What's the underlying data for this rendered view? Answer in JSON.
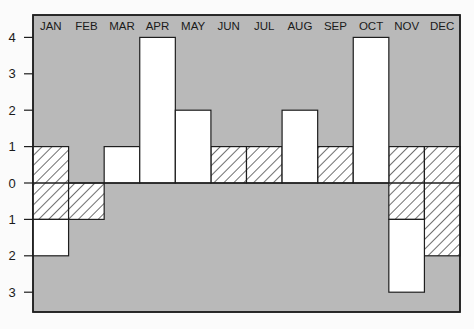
{
  "chart_data": {
    "type": "bar",
    "title": "",
    "xlabel": "",
    "ylabel": "",
    "categories": [
      "JAN",
      "FEB",
      "MAR",
      "APR",
      "MAY",
      "JUN",
      "JUL",
      "AUG",
      "SEP",
      "OCT",
      "NOV",
      "DEC"
    ],
    "series": [
      {
        "name": "Hatched band",
        "style": "hatched",
        "ranges": [
          [
            -1,
            1
          ],
          [
            -1,
            0
          ],
          null,
          null,
          null,
          [
            0,
            1
          ],
          [
            0,
            1
          ],
          null,
          [
            0,
            1
          ],
          null,
          [
            -1,
            1
          ],
          [
            -2,
            1
          ]
        ]
      },
      {
        "name": "White bar",
        "style": "white",
        "ranges": [
          [
            -2,
            -1
          ],
          null,
          [
            0,
            1
          ],
          [
            0,
            4
          ],
          [
            0,
            2
          ],
          null,
          null,
          [
            0,
            2
          ],
          null,
          [
            0,
            4
          ],
          [
            -3,
            -1
          ],
          null
        ]
      }
    ],
    "net_values": [
      -2,
      -1,
      1,
      4,
      2,
      1,
      1,
      2,
      1,
      4,
      -3,
      -2
    ],
    "y_ticks": [
      {
        "value": 4,
        "label": "4"
      },
      {
        "value": 3,
        "label": "3"
      },
      {
        "value": 2,
        "label": "2"
      },
      {
        "value": 1,
        "label": "1"
      },
      {
        "value": 0,
        "label": "0"
      },
      {
        "value": -1,
        "label": "1"
      },
      {
        "value": -2,
        "label": "2"
      },
      {
        "value": -3,
        "label": "3"
      }
    ],
    "ylim": [
      -3.6,
      4.6
    ],
    "grid": false,
    "legend": null,
    "colors": {
      "plot_background": "#b9b9b9",
      "bar_fill": "#ffffff",
      "hatch_line": "#222222",
      "axis": "#1e1e1e"
    }
  }
}
